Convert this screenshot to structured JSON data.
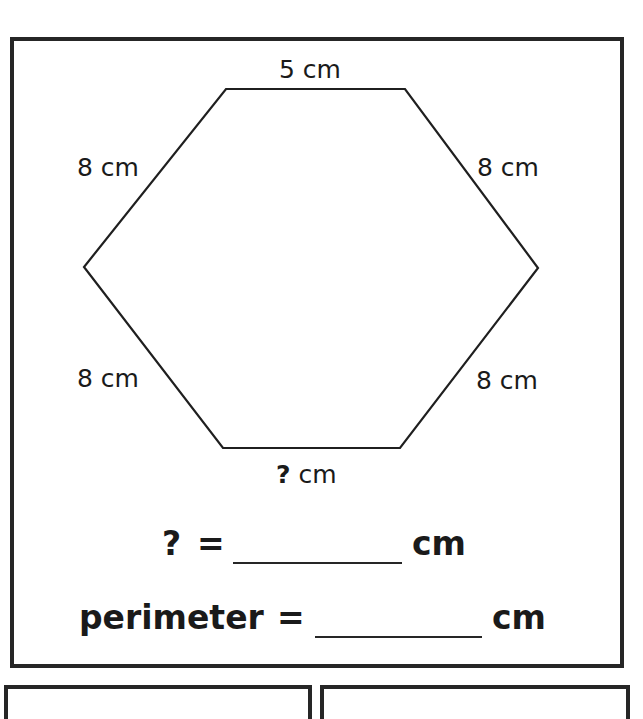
{
  "worksheet": {
    "shape": "hexagon",
    "side_labels": {
      "top": "5 cm",
      "upper_left": "8 cm",
      "upper_right": "8 cm",
      "lower_left": "8 cm",
      "lower_right": "8 cm",
      "bottom_unknown": "?",
      "bottom_unit": "cm"
    },
    "question_line": {
      "unknown": "?",
      "equals": "=",
      "unit": "cm"
    },
    "perimeter_line": {
      "label": "perimeter",
      "equals": "=",
      "unit": "cm"
    },
    "colors": {
      "ink": "#1a1a1a",
      "border": "#262626",
      "background": "#ffffff"
    }
  }
}
